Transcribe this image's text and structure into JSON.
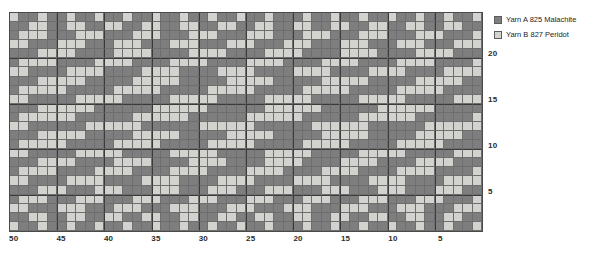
{
  "legend": {
    "position": "right-top",
    "entries": [
      {
        "label": "Yarn A 825 Malachite",
        "color": "#7e7e7e",
        "key": "a"
      },
      {
        "label": "Yarn B 827 Peridot",
        "color": "#d2d2ce",
        "key": "b"
      }
    ]
  },
  "chart_data": {
    "type": "heatmap",
    "title": "",
    "subtitle": "",
    "xlabel": "",
    "ylabel": "",
    "grid": true,
    "columns": 50,
    "rows": 24,
    "x_direction": "right-to-left",
    "y_direction": "bottom-to-top",
    "major_gridline_interval": 5,
    "xlim": [
      1,
      50
    ],
    "ylim": [
      1,
      24
    ],
    "xticks": [
      50,
      45,
      40,
      35,
      30,
      25,
      20,
      15,
      10,
      5
    ],
    "xtick_labels": [
      "50",
      "45",
      "40",
      "35",
      "30",
      "25",
      "20",
      "15",
      "10",
      "5"
    ],
    "yticks": [
      20,
      15,
      10,
      5
    ],
    "ytick_labels": [
      "20",
      "15",
      "10",
      "5"
    ],
    "value_map": {
      "a": "Yarn A 825 Malachite",
      "b": "Yarn B 827 Peridot"
    },
    "colors": {
      "a": "#7e7e7e",
      "b": "#d2d2ce"
    },
    "cells": [
      "baabaabaabaabaabaabaabaabaabaaabaabaabaabaabaabaaba",
      "aabbaabbaabbaabbaabbaabbaabbaabbaabbaabbaabbaabbaab",
      "abbbaaabbbaaabbbaaabbbaaabbbaaabbbaaabbbaaabbbaaabb",
      "bbaaabbbaaabbbaaabbbaaabbbaaabbbaaabbbaaabbbaaabbba",
      "aaabbbbaaaabbbbaaaabbbbaaaabbbbaaaabbbbaaaabbbbaaaa",
      "abbbbaaaabbbbaaaabbbbaaaabbbbaaaabbbbaaaabbbbaaaabb",
      "bbaaaabbbbaaaabbbbaaaabbbbaaaabbbbaaaabbbbaaaabbbba",
      "aaabbbbbaaaaabbbbbaaaaabbbbbaaaaabbbbbaaaaabbbbbaaa",
      "abbbbbaaaaabbbbbaaaaabbbbbaaaaabbbbbaaaaabbbbbaaaaa",
      "bbaaaaabbbbbaaaaabbbbbaaaaabbbbbaaaaabbbbbaaaaabbbb",
      "aaabbbbbbaaaaaabbbbbbaaaaaabbbbbbaaaaaabbbbbbaaaaaa",
      "abbbbbbaaaaaabbbbbbaaaaaabbbbbbaaaaaabbbbbbaaaaaabb",
      "bbaaaaaabbbbbbaaaaaabbbbbbaaaaaabbbbbbaaaaaabbbbbba",
      "aaabbbbbaaaaabbbbbaaaaabbbbbaaaaabbbbbaaaaabbbbbaaa",
      "abbbbbaaaaabbbbbaaaaabbbbbaaaaabbbbbaaaaabbbbbaaaaa",
      "bbaaaaabbbbbaaaaabbbbbaaaaabbbbbaaaaabbbbbaaaaabbbb",
      "aaabbbbaaaabbbbaaaabbbbaaaabbbbaaaabbbbaaaabbbbaaaa",
      "abbbbaaaabbbbaaaabbbbaaaabbbbaaaabbbbaaaabbbbaaaabb",
      "bbaaaabbbbaaaabbbbaaaabbbbaaaabbbbaaaabbbbaaaabbbba",
      "aaabbbaaabbbaaabbbaaabbbaaabbbaaabbbaaabbbaaabbbaaa",
      "abbbaaabbbaaabbbaaabbbaaabbbaaabbbaaabbbaaabbbaaabb",
      "bbaaabbbaaabbbaaabbbaaabbbaaabbbaaabbbaaabbbaaabbba",
      "aabbaabbaabbaabbaabbaabbaabbaabbaabbaabbaabbaabbaab",
      "baabaabaabaabaabaabaabaabaabaaabaabaabaabaabaabaaba"
    ]
  }
}
